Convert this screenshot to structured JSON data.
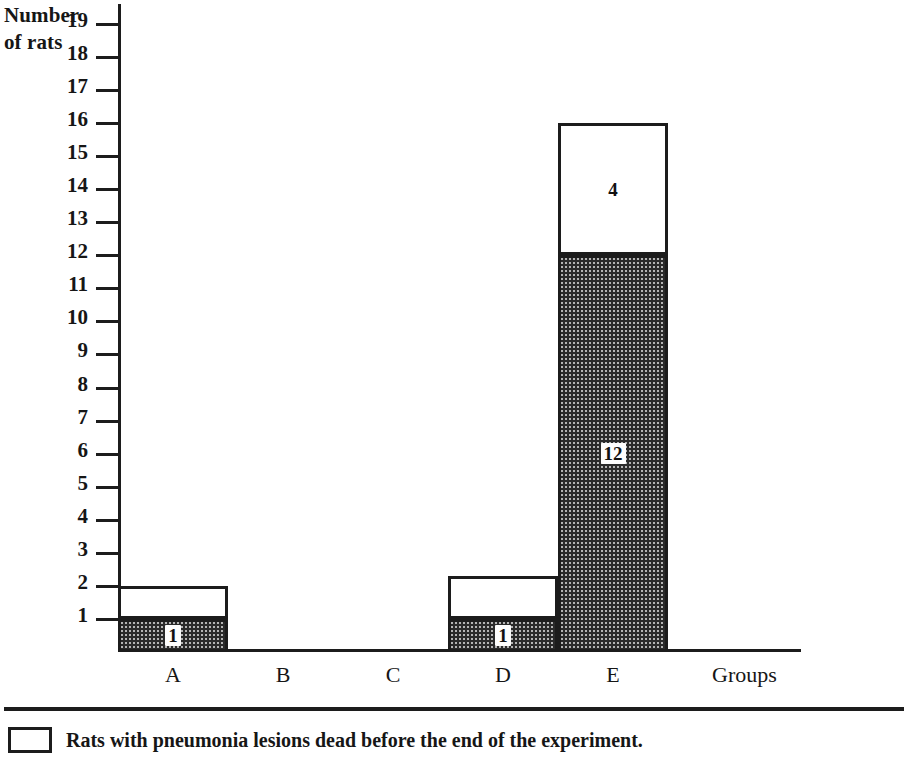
{
  "chart_data": {
    "type": "bar",
    "subtype": "stacked-bar",
    "title": "",
    "xlabel": "Groups",
    "ylabel": "Number of rats",
    "ylabel_lines": [
      "Number",
      "of rats"
    ],
    "categories": [
      "A",
      "B",
      "C",
      "D",
      "E"
    ],
    "ytick_labels": [
      "19",
      "18",
      "17",
      "16",
      "15",
      "14",
      "13",
      "12",
      "11",
      "10",
      "9",
      "8",
      "7",
      "6",
      "5",
      "4",
      "3",
      "2",
      "1"
    ],
    "ytick_values": [
      19,
      18,
      17,
      16,
      15,
      14,
      13,
      12,
      11,
      10,
      9,
      8,
      7,
      6,
      5,
      4,
      3,
      2,
      1
    ],
    "ylim": [
      0,
      19.6
    ],
    "grid": false,
    "legend_position": "below-axes",
    "series": [
      {
        "name": "hatched-segment",
        "fill": "hatched",
        "values": [
          1,
          0,
          0,
          1,
          12
        ],
        "labels": [
          "1",
          "",
          "",
          "1",
          "12"
        ]
      },
      {
        "name": "white-segment",
        "fill": "white",
        "values": [
          1,
          0,
          0,
          1.3,
          4
        ],
        "labels": [
          "",
          "",
          "",
          "",
          "4"
        ]
      }
    ],
    "totals": [
      2,
      0,
      0,
      2.3,
      16
    ],
    "legend": [
      {
        "swatch": "white",
        "label": "Rats with pneumonia lesions dead before the end of the experiment."
      }
    ]
  },
  "colors": {
    "ink": "#1c1c1c",
    "paper": "#ffffff",
    "hatch": "#b4b4b4"
  }
}
